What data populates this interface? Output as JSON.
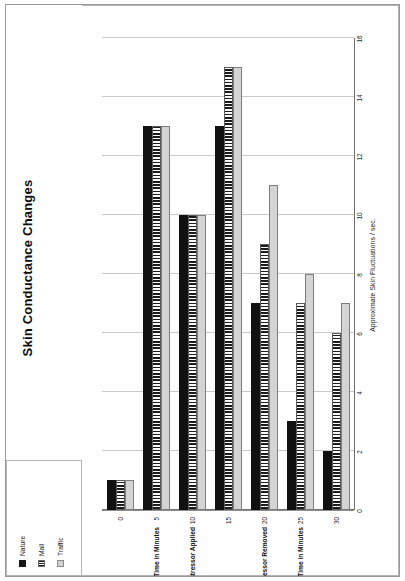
{
  "document": {
    "kind": "printed-chart-page",
    "orientation_note": "landscape chart printed on a portrait page, rotated 90 degrees counter-clockwise"
  },
  "legend": {
    "position": "top-left",
    "items": [
      {
        "label": "Nature",
        "pattern": "solid-black",
        "color": "#111111"
      },
      {
        "label": "Mall",
        "pattern": "vertical-stripes",
        "color": "#1b1b1b"
      },
      {
        "label": "Traffic",
        "pattern": "light-gray-fill",
        "color": "#d4d4d4"
      }
    ]
  },
  "chart_data": {
    "type": "bar",
    "orientation": "vertical-bars-rotated",
    "title": "Skin Conductance Changes",
    "xlabel": "Time in Minutes",
    "ylabel": "Approximate Skin Fluctuations / sec.",
    "categories": [
      "0",
      "5",
      "10",
      "15",
      "20",
      "25",
      "30"
    ],
    "x_tick_labels": [
      "0",
      "5",
      "10",
      "15",
      "20",
      "25",
      "30"
    ],
    "y_tick_labels": [
      "0",
      "2",
      "4",
      "6",
      "8",
      "10",
      "12",
      "14",
      "16"
    ],
    "ylim": [
      0,
      16
    ],
    "y_tick_step": 2,
    "grid": "value-axis-gridlines-only",
    "legend_position": "top-left",
    "annotations": [
      {
        "text": "Time in Minutes",
        "at_category": "5"
      },
      {
        "text": "Stressor Applied",
        "at_category": "10"
      },
      {
        "text": "Stressor Removed",
        "at_category": "20"
      },
      {
        "text": "Time in Minutes",
        "at_category": "25"
      }
    ],
    "series": [
      {
        "name": "Nature",
        "values": [
          1,
          13,
          10,
          13,
          7,
          3,
          2
        ]
      },
      {
        "name": "Mall",
        "values": [
          1,
          13,
          10,
          15,
          9,
          7,
          6
        ]
      },
      {
        "name": "Traffic",
        "values": [
          1,
          13,
          10,
          15,
          11,
          8,
          7
        ]
      }
    ]
  }
}
